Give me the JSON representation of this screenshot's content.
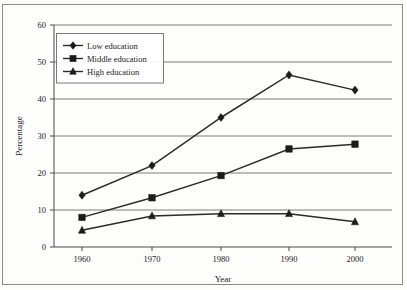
{
  "chart_data": {
    "type": "line",
    "title": "",
    "xlabel": "Year",
    "ylabel": "Percentage",
    "categories": [
      "1960",
      "1970",
      "1980",
      "1990",
      "2000"
    ],
    "x": [
      1960,
      1970,
      1980,
      1990,
      2000
    ],
    "xlim": [
      1955,
      2005
    ],
    "ylim": [
      0,
      60
    ],
    "yticks": [
      "0",
      "10",
      "20",
      "30",
      "40",
      "50",
      "60"
    ],
    "ytick_values": [
      0,
      10,
      20,
      30,
      40,
      50,
      60
    ],
    "grid": "horizontal",
    "legend_position": "top-left",
    "series": [
      {
        "name": "Low education",
        "marker": "diamond",
        "color": "#1c1c1c",
        "values": [
          14.0,
          22.0,
          35.0,
          46.5,
          42.4
        ]
      },
      {
        "name": "Middle education",
        "marker": "square",
        "color": "#1c1c1c",
        "values": [
          8.0,
          13.3,
          19.3,
          26.5,
          27.8
        ]
      },
      {
        "name": "High education",
        "marker": "triangle",
        "color": "#1c1c1c",
        "values": [
          4.5,
          8.4,
          9.0,
          9.0,
          6.8
        ]
      }
    ]
  },
  "legend": {
    "items": [
      {
        "label": "Low education",
        "marker": "diamond-marker-icon"
      },
      {
        "label": "Middle education",
        "marker": "square-marker-icon"
      },
      {
        "label": "High education",
        "marker": "triangle-marker-icon"
      }
    ]
  },
  "axes": {
    "x_title": "Year",
    "y_title": "Percentage",
    "x_tick_labels": [
      "1960",
      "1970",
      "1980",
      "1990",
      "2000"
    ],
    "y_tick_labels": [
      "0",
      "10",
      "20",
      "30",
      "40",
      "50",
      "60"
    ]
  }
}
